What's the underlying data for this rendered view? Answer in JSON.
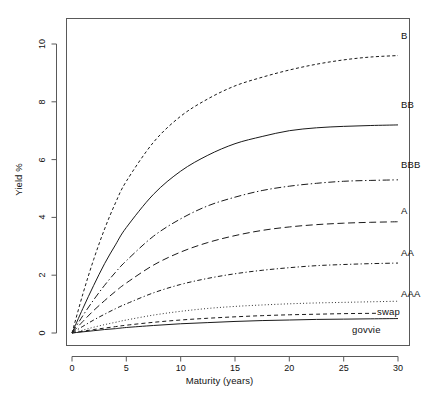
{
  "chart_data": {
    "type": "line",
    "title": "",
    "xlabel": "Maturity (years)",
    "ylabel": "Yield %",
    "xlim": [
      0,
      30
    ],
    "ylim": [
      0,
      10.4
    ],
    "xticks": [
      0,
      5,
      10,
      15,
      20,
      25,
      30
    ],
    "yticks": [
      0,
      2,
      4,
      6,
      8,
      10
    ],
    "grid": false,
    "legend_position": "right-of-curve-ends",
    "x": [
      0,
      1,
      2,
      3,
      4,
      5,
      7.5,
      10,
      12.5,
      15,
      17.5,
      20,
      22.5,
      25,
      27.5,
      30
    ],
    "series": [
      {
        "name": "B",
        "label": "B",
        "linestyle": "dashed-fine",
        "values": [
          0,
          1.35,
          2.55,
          3.6,
          4.5,
          5.25,
          6.6,
          7.5,
          8.1,
          8.55,
          8.85,
          9.1,
          9.3,
          9.45,
          9.55,
          9.6
        ],
        "end_value": 9.6
      },
      {
        "name": "BB",
        "label": "BB",
        "linestyle": "solid",
        "values": [
          0,
          0.85,
          1.65,
          2.4,
          3.05,
          3.65,
          4.8,
          5.6,
          6.15,
          6.55,
          6.8,
          7.0,
          7.1,
          7.15,
          7.18,
          7.2
        ],
        "end_value": 7.2
      },
      {
        "name": "BBB",
        "label": "BBB",
        "linestyle": "dashdot",
        "values": [
          0,
          0.6,
          1.15,
          1.65,
          2.1,
          2.5,
          3.35,
          3.95,
          4.4,
          4.7,
          4.93,
          5.08,
          5.18,
          5.25,
          5.28,
          5.3
        ],
        "end_value": 5.3
      },
      {
        "name": "A",
        "label": "A",
        "linestyle": "dashed-long",
        "values": [
          0,
          0.4,
          0.78,
          1.12,
          1.44,
          1.73,
          2.35,
          2.8,
          3.13,
          3.37,
          3.55,
          3.67,
          3.75,
          3.8,
          3.83,
          3.85
        ],
        "end_value": 3.85
      },
      {
        "name": "AA",
        "label": "AA",
        "linestyle": "dashdot-fine",
        "values": [
          0,
          0.23,
          0.45,
          0.65,
          0.84,
          1.01,
          1.39,
          1.68,
          1.89,
          2.05,
          2.17,
          2.26,
          2.33,
          2.37,
          2.4,
          2.42
        ],
        "end_value": 2.42
      },
      {
        "name": "AAA",
        "label": "AAA",
        "linestyle": "dotted",
        "values": [
          0,
          0.1,
          0.2,
          0.29,
          0.37,
          0.45,
          0.62,
          0.75,
          0.85,
          0.92,
          0.97,
          1.01,
          1.04,
          1.06,
          1.08,
          1.1
        ],
        "end_value": 1.1
      },
      {
        "name": "swap",
        "label": "swap",
        "linestyle": "dashed-medium",
        "values": [
          0,
          0.06,
          0.12,
          0.17,
          0.22,
          0.27,
          0.37,
          0.45,
          0.51,
          0.56,
          0.6,
          0.63,
          0.65,
          0.67,
          0.68,
          0.69
        ],
        "end_value": 0.69
      },
      {
        "name": "govvie",
        "label": "govvie",
        "linestyle": "solid",
        "values": [
          0,
          0.04,
          0.08,
          0.12,
          0.15,
          0.19,
          0.26,
          0.32,
          0.36,
          0.4,
          0.43,
          0.45,
          0.47,
          0.48,
          0.49,
          0.5
        ],
        "end_value": 0.5
      }
    ]
  },
  "axes": {
    "x_title": "Maturity (years)",
    "y_title": "Yield %",
    "x_tick_labels": [
      "0",
      "5",
      "10",
      "15",
      "20",
      "25",
      "30"
    ],
    "y_tick_labels": [
      "0",
      "2",
      "4",
      "6",
      "8",
      "10"
    ]
  },
  "labels": {
    "b": "B",
    "bb": "BB",
    "bbb": "BBB",
    "a": "A",
    "aa": "AA",
    "aaa": "AAA",
    "swap": "swap",
    "govvie": "govvie"
  },
  "colors": {
    "line": "#1a1a1a",
    "axis": "#4d4d4d",
    "background": "#ffffff"
  }
}
